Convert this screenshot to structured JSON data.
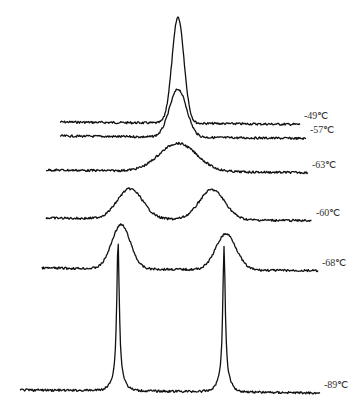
{
  "chart_data": {
    "type": "line",
    "title": "",
    "xlabel": "",
    "ylabel": "",
    "grid": false,
    "legend": "none; each trace labeled at right end",
    "series": [
      {
        "name": "-49℃",
        "baseline_y": 122,
        "x_range": [
          60,
          300
        ],
        "peaks": [
          {
            "x": 178,
            "height": 106,
            "width": 14
          }
        ]
      },
      {
        "name": "-57℃",
        "baseline_y": 136,
        "x_range": [
          60,
          306
        ],
        "peaks": [
          {
            "x": 178,
            "height": 48,
            "width": 20
          }
        ]
      },
      {
        "name": "-63℃",
        "baseline_y": 170,
        "x_range": [
          46,
          308
        ],
        "peaks": [
          {
            "x": 178,
            "height": 28,
            "width": 44
          }
        ]
      },
      {
        "name": "-60℃",
        "baseline_y": 218,
        "x_range": [
          46,
          312
        ],
        "peaks": [
          {
            "x": 130,
            "height": 30,
            "width": 30
          },
          {
            "x": 212,
            "height": 30,
            "width": 30
          }
        ]
      },
      {
        "name": "-68℃",
        "baseline_y": 268,
        "x_range": [
          42,
          318
        ],
        "peaks": [
          {
            "x": 121,
            "height": 44,
            "width": 22
          },
          {
            "x": 226,
            "height": 36,
            "width": 24
          }
        ]
      },
      {
        "name": "-89℃",
        "baseline_y": 390,
        "x_range": [
          20,
          320
        ],
        "peaks": [
          {
            "x": 118,
            "height": 140,
            "width": 3
          },
          {
            "x": 224,
            "height": 135,
            "width": 3
          }
        ]
      }
    ],
    "labels": [
      "-49℃",
      "-57℃",
      "-63℃",
      "-60℃",
      "-68℃",
      "-89℃"
    ]
  }
}
